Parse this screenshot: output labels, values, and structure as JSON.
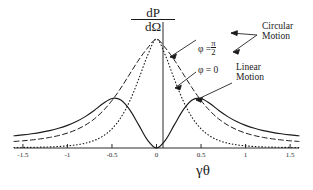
{
  "figure": {
    "kind": "radiation-pattern-plot",
    "y_axis_title_numerator": "dP",
    "y_axis_title_denominator": "dΩ",
    "x_axis_title": "γθ"
  },
  "annotations": {
    "phi_pi_over_2": {
      "lead": "φ =",
      "num": "π",
      "den": "2"
    },
    "phi_zero": "φ = 0",
    "circular_motion_line1": "Circular",
    "circular_motion_line2": "Motion",
    "linear_motion_line1": "Linear",
    "linear_motion_line2": "Motion"
  },
  "colors": {
    "ink": "#1a1a1a",
    "axis": "#2b2b2b",
    "curve": "#1a1a1a",
    "background": "#ffffff"
  },
  "chart_data": {
    "type": "line",
    "title": "",
    "xlabel": "γθ",
    "ylabel": "dP/dΩ",
    "xlim": [
      -1.6,
      1.6
    ],
    "ylim": [
      0,
      1.12
    ],
    "grid": false,
    "legend": "annotated-inline",
    "xticks": [
      -1.5,
      -1,
      -0.5,
      0,
      0.5,
      1,
      1.5
    ],
    "xticklabels": [
      "-1.5",
      "-1",
      "-0.5",
      "0",
      "0.5",
      "1",
      "1.5"
    ],
    "yticks": [],
    "yticklabels": [],
    "x": [
      -1.6,
      -1.5,
      -1.4,
      -1.3,
      -1.2,
      -1.1,
      -1.0,
      -0.9,
      -0.8,
      -0.7,
      -0.6,
      -0.5,
      -0.4,
      -0.3,
      -0.2,
      -0.1,
      0.0,
      0.1,
      0.2,
      0.3,
      0.4,
      0.5,
      0.6,
      0.7,
      0.8,
      0.9,
      1.0,
      1.1,
      1.2,
      1.3,
      1.4,
      1.5,
      1.6
    ],
    "series": [
      {
        "name": "Circular Motion, φ = π/2",
        "style": "dashed",
        "values": [
          0.06,
          0.066,
          0.074,
          0.084,
          0.097,
          0.114,
          0.137,
          0.168,
          0.21,
          0.266,
          0.341,
          0.436,
          0.551,
          0.68,
          0.808,
          0.918,
          1.0,
          0.918,
          0.808,
          0.68,
          0.551,
          0.436,
          0.341,
          0.266,
          0.21,
          0.168,
          0.137,
          0.114,
          0.097,
          0.084,
          0.074,
          0.066,
          0.06
        ]
      },
      {
        "name": "Circular Motion, φ = 0",
        "style": "dotted",
        "values": [
          0.004,
          0.005,
          0.006,
          0.008,
          0.01,
          0.014,
          0.02,
          0.029,
          0.044,
          0.069,
          0.11,
          0.176,
          0.28,
          0.432,
          0.632,
          0.85,
          1.0,
          0.85,
          0.632,
          0.432,
          0.28,
          0.176,
          0.11,
          0.069,
          0.044,
          0.029,
          0.02,
          0.014,
          0.01,
          0.008,
          0.006,
          0.005,
          0.004
        ]
      },
      {
        "name": "Linear Motion",
        "style": "solid",
        "values": [
          0.112,
          0.12,
          0.131,
          0.144,
          0.16,
          0.181,
          0.208,
          0.243,
          0.288,
          0.344,
          0.408,
          0.455,
          0.44,
          0.35,
          0.212,
          0.072,
          0.0,
          0.072,
          0.212,
          0.35,
          0.44,
          0.455,
          0.408,
          0.344,
          0.288,
          0.243,
          0.208,
          0.181,
          0.16,
          0.144,
          0.131,
          0.12,
          0.112
        ]
      }
    ]
  }
}
